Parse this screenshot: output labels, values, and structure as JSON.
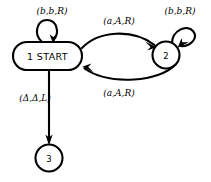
{
  "diagram": {
    "kind": "turing-machine-state-diagram",
    "background_color": "#ffffff",
    "stroke_color": "#000000",
    "states": [
      {
        "id": "1",
        "label": "1 START",
        "shape": "stadium",
        "is_start": true,
        "x": 47.5,
        "y": 56,
        "width": 69,
        "height": 28
      },
      {
        "id": "2",
        "label": "2",
        "shape": "circle",
        "is_start": false,
        "x": 166,
        "y": 55,
        "radius": 13.5
      },
      {
        "id": "3",
        "label": "3",
        "shape": "circle",
        "is_start": false,
        "x": 49,
        "y": 158,
        "radius": 13.5
      }
    ],
    "transitions": [
      {
        "name": "loop-state-1",
        "from": "1",
        "to": "1",
        "label": "(b,b,R)",
        "label_x": 52,
        "label_y": 10,
        "kind": "self-loop-top"
      },
      {
        "name": "edge-1-to-2",
        "from": "1",
        "to": "2",
        "label": "(a,A,R)",
        "label_x": 119,
        "label_y": 20,
        "kind": "arc-upper"
      },
      {
        "name": "edge-2-to-1",
        "from": "2",
        "to": "1",
        "label": "(a,A,R)",
        "label_x": 119,
        "label_y": 92,
        "kind": "arc-lower"
      },
      {
        "name": "loop-state-2",
        "from": "2",
        "to": "2",
        "label": "(b,b,R)",
        "label_x": 180,
        "label_y": 10,
        "kind": "self-loop-upper-right"
      },
      {
        "name": "edge-1-to-3",
        "from": "1",
        "to": "3",
        "label": "(Δ,Δ,L)",
        "label_x": 35,
        "label_y": 97,
        "kind": "straight-down"
      }
    ]
  }
}
